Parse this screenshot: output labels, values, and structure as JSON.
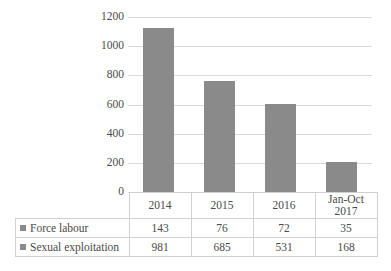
{
  "chart_data": {
    "type": "bar",
    "title": "",
    "subtitle": "",
    "xlabel": "",
    "ylabel": "",
    "grid": true,
    "legend_position": "table-left",
    "categories": [
      "2014",
      "2015",
      "2016",
      "Jan-Oct 2017"
    ],
    "category_lines": [
      [
        "2014"
      ],
      [
        "2015"
      ],
      [
        "2016"
      ],
      [
        "Jan-Oct",
        "2017"
      ]
    ],
    "ylim": [
      0,
      1200
    ],
    "yticks": [
      1200,
      1000,
      800,
      600,
      400,
      200,
      0
    ],
    "ytick_labels": [
      "1200",
      "1000",
      "800",
      "600",
      "400",
      "200",
      "0"
    ],
    "series": [
      {
        "name": "Force labour",
        "values": [
          143,
          76,
          72,
          35
        ],
        "color": "#8a8a8a"
      },
      {
        "name": "Sexual exploitation",
        "values": [
          981,
          685,
          531,
          168
        ],
        "color": "#8a8a8a"
      }
    ],
    "bar_totals": [
      1124,
      761,
      603,
      203
    ],
    "bar_color": "#8a8a8a",
    "gridline_color": "#d9d9d9",
    "table_border_color": "#d0d0d0"
  },
  "table": {
    "row_labels": [
      "Force labour",
      "Sexual exploitation"
    ],
    "columns": [
      "2014",
      "2015",
      "2016",
      "Jan-Oct 2017"
    ],
    "rows": [
      [
        "143",
        "76",
        "72",
        "35"
      ],
      [
        "981",
        "685",
        "531",
        "168"
      ]
    ]
  }
}
